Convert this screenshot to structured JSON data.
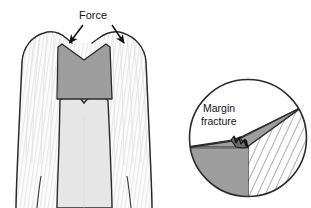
{
  "figure": {
    "background_color": "#ffffff"
  },
  "labels": {
    "force": "Force",
    "margin": "Margin",
    "fracture": "fracture"
  },
  "colors": {
    "outline": "#2b2b2b",
    "cavity_fill": "#9e9e9e",
    "enamel_fill": "#fbfbfb",
    "dentin_fill": "#f2f2f2",
    "pulp_fill": "#e3e3e3",
    "restoration_gray": "#9e9e9e",
    "hatch_line": "#6e6e6e",
    "text": "#141414",
    "arrow": "#111111"
  },
  "tooth_diagram": {
    "name": "tooth-cross-section",
    "description": "Molar crown and root cross-section, enamel outline with vertical striations, central pulp chamber, trapezoidal gray cavity preparation at occlusal surface",
    "cavity": {
      "name": "cavity-preparation",
      "shape": "trapezoid-with-v-notch-top",
      "fill": "#9e9e9e"
    },
    "force_arrows": [
      {
        "name": "force-arrow-left",
        "x1": 82,
        "y1": 25,
        "x2": 69,
        "y2": 44,
        "direction": "down-left"
      },
      {
        "name": "force-arrow-right",
        "x1": 113,
        "y1": 25,
        "x2": 124,
        "y2": 44,
        "direction": "down-right"
      }
    ]
  },
  "inset_diagram": {
    "name": "magnified-circular-inset",
    "description": "Circular magnification showing interface between hatched enamel (right) and gray restoration (left) with a stepped margin fracture at the junction",
    "circle": {
      "cx": 248,
      "cy": 138,
      "r": 59
    },
    "hatched_region": {
      "name": "enamel-hatched-region",
      "pattern": "diagonal-lines",
      "line_color": "#6e6e6e"
    },
    "gray_wedge": {
      "name": "restoration-gray-wedge",
      "fill": "#9e9e9e"
    },
    "fracture_marker": {
      "name": "margin-fracture-notch",
      "description": "small stepped zig-zag chip at the restoration margin"
    },
    "leader_line": {
      "name": "margin-fracture-leader",
      "from": [
        218,
        122
      ],
      "to": [
        238,
        140
      ]
    }
  }
}
